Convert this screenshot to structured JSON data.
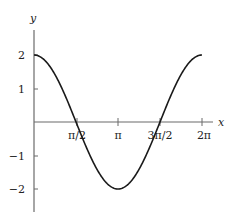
{
  "chart_data": {
    "type": "line",
    "title": "",
    "xlabel": "x",
    "ylabel": "y",
    "function": "y = 2cos(x)",
    "xlim": [
      0,
      6.2832
    ],
    "ylim": [
      -2.7,
      2.8
    ],
    "grid": false,
    "legend": null,
    "x_ticks": [
      {
        "value": 1.5708,
        "label": "π/2"
      },
      {
        "value": 3.1416,
        "label": "π"
      },
      {
        "value": 4.7124,
        "label": "3π/2"
      },
      {
        "value": 6.2832,
        "label": "2π"
      }
    ],
    "y_ticks": [
      {
        "value": 2,
        "label": "2"
      },
      {
        "value": 1,
        "label": "1"
      },
      {
        "value": -1,
        "label": "−1"
      },
      {
        "value": -2,
        "label": "−2"
      }
    ],
    "series": [
      {
        "name": "2cos(x)",
        "color": "#1a1a1a",
        "x": [
          0,
          0.7854,
          1.5708,
          2.3562,
          3.1416,
          3.927,
          4.7124,
          5.4978,
          6.2832
        ],
        "values": [
          2,
          1.414,
          0,
          -1.414,
          -2,
          -1.414,
          0,
          1.414,
          2
        ]
      }
    ]
  },
  "labels": {
    "x_axis": "x",
    "y_axis": "y",
    "x_tick_0": "π/2",
    "x_tick_1": "π",
    "x_tick_2": "3π/2",
    "x_tick_3": "2π",
    "y_tick_0": "2",
    "y_tick_1": "1",
    "y_tick_2": "−1",
    "y_tick_3": "−2"
  },
  "colors": {
    "axis": "#6b6b6b",
    "curve": "#1a1a1a",
    "text": "#222222"
  }
}
